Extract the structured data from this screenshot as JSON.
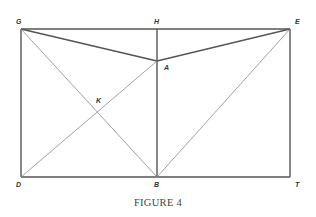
{
  "figure": {
    "caption": "FIGURE 4",
    "points": {
      "G": {
        "label": "G",
        "x": 21,
        "y": 29,
        "lx": 16,
        "ly": 24
      },
      "H": {
        "label": "H",
        "x": 157,
        "y": 29,
        "lx": 154,
        "ly": 24
      },
      "E": {
        "label": "E",
        "x": 290,
        "y": 29,
        "lx": 295,
        "ly": 24
      },
      "A": {
        "label": "A",
        "x": 157,
        "y": 61,
        "lx": 164,
        "ly": 70
      },
      "K": {
        "label": "K",
        "x": 97,
        "y": 112,
        "lx": 96,
        "ly": 103
      },
      "D": {
        "label": "D",
        "x": 21,
        "y": 177,
        "lx": 16,
        "ly": 187
      },
      "B": {
        "label": "B",
        "x": 157,
        "y": 177,
        "lx": 154,
        "ly": 187
      },
      "T": {
        "label": "T",
        "x": 290,
        "y": 177,
        "lx": 295,
        "ly": 187
      }
    },
    "segments": [
      {
        "from": "G",
        "to": "E",
        "weight": "thick"
      },
      {
        "from": "E",
        "to": "T",
        "weight": "thick"
      },
      {
        "from": "T",
        "to": "D",
        "weight": "thick"
      },
      {
        "from": "D",
        "to": "G",
        "weight": "thick"
      },
      {
        "from": "H",
        "to": "B",
        "weight": "thick"
      },
      {
        "from": "G",
        "to": "A",
        "weight": "thick"
      },
      {
        "from": "A",
        "to": "E",
        "weight": "thick"
      },
      {
        "from": "G",
        "to": "B",
        "weight": "thin"
      },
      {
        "from": "D",
        "to": "A",
        "weight": "thin"
      },
      {
        "from": "B",
        "to": "E",
        "weight": "thin"
      }
    ],
    "colors": {
      "line": "#555555",
      "thin_line": "#8a8a8a",
      "label": "#333333"
    }
  }
}
